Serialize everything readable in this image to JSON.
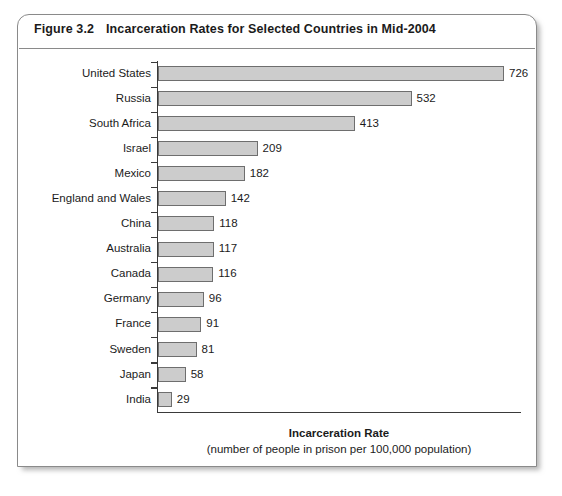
{
  "figure": {
    "number": "Figure 3.2",
    "title": "Incarceration Rates for Selected Countries in Mid-2004"
  },
  "chart_data": {
    "type": "bar",
    "orientation": "horizontal",
    "title": "Incarceration Rates for Selected Countries in Mid-2004",
    "xlabel": "Incarceration Rate",
    "xlabel_sub": "(number of people in prison per 100,000 population)",
    "ylabel": "",
    "xlim": [
      0,
      726
    ],
    "grid": false,
    "legend": false,
    "value_labels": true,
    "categories": [
      "United States",
      "Russia",
      "South Africa",
      "Israel",
      "Mexico",
      "England and Wales",
      "China",
      "Australia",
      "Canada",
      "Germany",
      "France",
      "Sweden",
      "Japan",
      "India"
    ],
    "values": [
      726,
      532,
      413,
      209,
      182,
      142,
      118,
      117,
      116,
      96,
      91,
      81,
      58,
      29
    ],
    "bar_fill": "#cccccc",
    "bar_border": "#6e6e6e",
    "axis_color": "#3a3a3a"
  },
  "page_caption": ""
}
